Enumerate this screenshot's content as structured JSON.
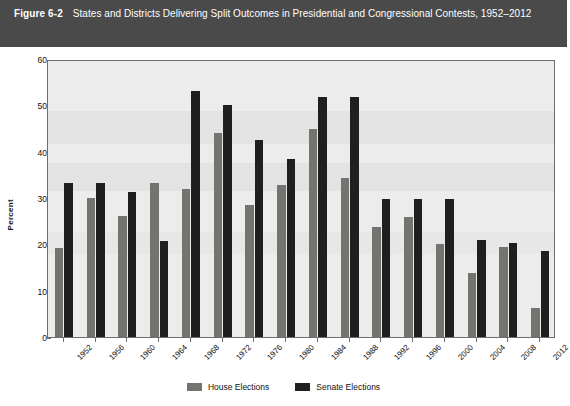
{
  "header": {
    "figure_number": "Figure 6-2",
    "title": "States and Districts Delivering Split Outcomes in Presidential and Congressional Contests, 1952–2012"
  },
  "legend": {
    "position": "bottom-center",
    "items": [
      {
        "label": "House Elections",
        "color": "#73736f"
      },
      {
        "label": "Senate Elections",
        "color": "#201f1d"
      }
    ]
  },
  "axes": {
    "y_title": "Percent",
    "y_ticks": [
      "0",
      "10",
      "20",
      "30",
      "40",
      "50",
      "60"
    ]
  },
  "chart_data": {
    "type": "bar",
    "title": "States and Districts Delivering Split Outcomes in Presidential and Congressional Contests, 1952–2012",
    "xlabel": "",
    "ylabel": "Percent",
    "ylim": [
      0,
      60
    ],
    "ytick_step": 10,
    "grid": false,
    "legend_position": "bottom-center",
    "categories": [
      "1952",
      "1956",
      "1960",
      "1964",
      "1968",
      "1972",
      "1976",
      "1980",
      "1984",
      "1988",
      "1992",
      "1996",
      "2000",
      "2004",
      "2008",
      "2012"
    ],
    "series": [
      {
        "name": "House Elections",
        "color": "#73736f",
        "values": [
          19.3,
          29.9,
          26.1,
          33.3,
          32.0,
          44.1,
          28.5,
          32.8,
          45.0,
          34.3,
          23.8,
          25.9,
          20.0,
          13.8,
          19.5,
          6.3
        ]
      },
      {
        "name": "Senate Elections",
        "color": "#201f1d",
        "values": [
          33.3,
          33.3,
          31.3,
          20.8,
          53.0,
          50.0,
          42.5,
          38.5,
          51.7,
          51.7,
          29.7,
          29.8,
          29.8,
          20.9,
          20.3,
          18.5
        ]
      }
    ]
  }
}
